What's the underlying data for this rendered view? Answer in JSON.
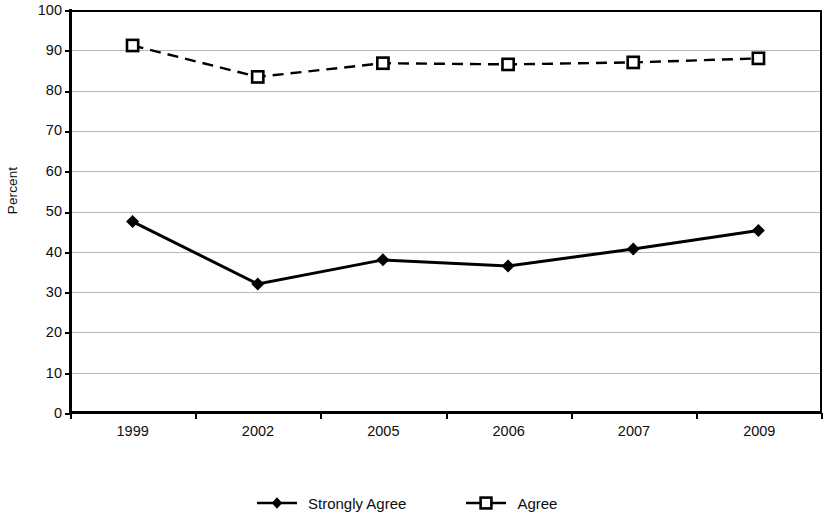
{
  "chart_data": {
    "type": "line",
    "title": "",
    "xlabel": "",
    "ylabel": "Percent",
    "categories": [
      "1999",
      "2002",
      "2005",
      "2006",
      "2007",
      "2009"
    ],
    "ylim": [
      0,
      100
    ],
    "y_ticks": [
      100,
      90,
      80,
      70,
      60,
      50,
      40,
      30,
      20,
      10,
      0
    ],
    "grid": "horizontal",
    "legend_position": "bottom",
    "series": [
      {
        "name": "Strongly Agree",
        "values": [
          47.5,
          32.0,
          38.0,
          36.5,
          40.7,
          45.3
        ],
        "line_style": "solid",
        "marker": "filled-diamond",
        "color": "#000000"
      },
      {
        "name": "Agree",
        "values": [
          91.2,
          83.4,
          86.8,
          86.5,
          87.0,
          88.0
        ],
        "line_style": "dashed",
        "marker": "open-square",
        "color": "#000000"
      }
    ]
  },
  "axis": {
    "y_title": "Percent",
    "y_tick_labels": [
      "100",
      "90",
      "80",
      "70",
      "60",
      "50",
      "40",
      "30",
      "20",
      "10",
      "0"
    ],
    "x_tick_labels": [
      "1999",
      "2002",
      "2005",
      "2006",
      "2007",
      "2009"
    ]
  },
  "legend": {
    "items": [
      {
        "label": "Strongly Agree",
        "marker": "filled-diamond-icon"
      },
      {
        "label": "Agree",
        "marker": "open-square-icon"
      }
    ]
  },
  "colors": {
    "axis": "#000000",
    "gridline": "#b9b9b9",
    "series": "#000000",
    "background": "#ffffff"
  }
}
